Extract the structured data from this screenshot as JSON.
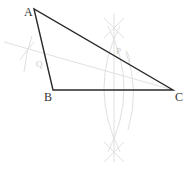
{
  "diagram": {
    "colors": {
      "edge": "#2a2a2a",
      "construction": "#dcdcdc",
      "label": "#333333",
      "faint_label": "#c8c8c8"
    },
    "vertices": {
      "A": {
        "label": "A",
        "x": 34,
        "y": 9
      },
      "B": {
        "label": "B",
        "x": 53,
        "y": 90
      },
      "C": {
        "label": "C",
        "x": 173,
        "y": 90
      }
    },
    "construction_points": {
      "Q": {
        "label": "Q",
        "x": 39,
        "y": 64
      },
      "P": {
        "label": "P",
        "x": 118,
        "y": 52
      }
    },
    "edges": [
      "AB",
      "BC",
      "CA"
    ]
  }
}
